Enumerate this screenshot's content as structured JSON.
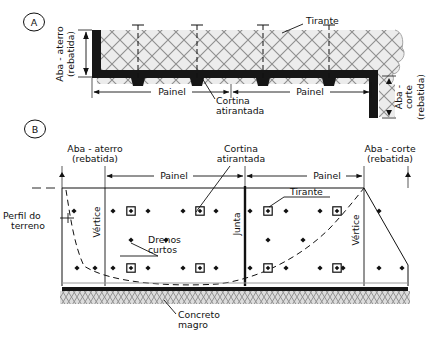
{
  "figure": {
    "panel_a": {
      "tag": "A",
      "labels": {
        "aba_aterro_l1": "Aba - aterro",
        "aba_aterro_l2": "(rebatida)",
        "tirante": "Tirante",
        "painel_left": "Painel",
        "painel_right": "Painel",
        "cortina_l1": "Cortina",
        "cortina_l2": "atirantada",
        "aba_corte_l1": "Aba -",
        "aba_corte_l2": "corte",
        "aba_corte_l3": "(rebatida)"
      },
      "tirante_count": 4,
      "panel_count": 2
    },
    "panel_b": {
      "tag": "B",
      "labels": {
        "aba_aterro_l1": "Aba - aterro",
        "aba_aterro_l2": "(rebatida)",
        "aba_corte_l1": "Aba - corte",
        "aba_corte_l2": "(rebatida)",
        "cortina_l1": "Cortina",
        "cortina_l2": "atirantada",
        "painel_left": "Painel",
        "painel_right": "Painel",
        "vertice_left": "Vértice",
        "vertice_right": "Vértice",
        "junta": "Junta",
        "tirante": "Tirante",
        "perfil_l1": "Perfil do",
        "perfil_l2": "terreno",
        "drenos_l1": "Drenos",
        "drenos_l2": "curtos",
        "concreto_l1": "Concreto",
        "concreto_l2": "magro"
      }
    },
    "colors": {
      "ink": "#111111",
      "fill_dark": "#1a1a1a",
      "hatch_gray": "#9a9a9a",
      "hatch_bg": "#e8e8e8",
      "line": "#1d1d1d"
    }
  }
}
